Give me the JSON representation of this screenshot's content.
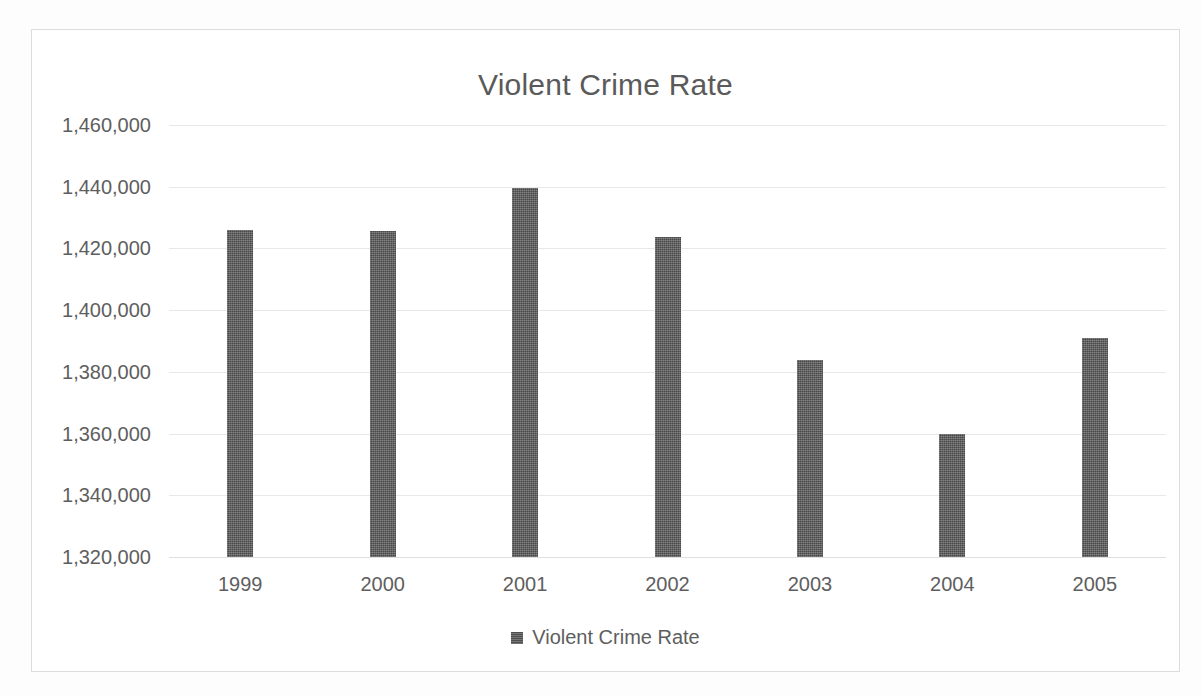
{
  "chart_data": {
    "type": "bar",
    "title": "Violent Crime Rate",
    "xlabel": "",
    "ylabel": "",
    "categories": [
      "1999",
      "2000",
      "2001",
      "2002",
      "2003",
      "2004",
      "2005"
    ],
    "values": [
      1426000,
      1425500,
      1439500,
      1423800,
      1384000,
      1360000,
      1391000
    ],
    "series": [
      {
        "name": "Violent Crime Rate",
        "values": [
          1426000,
          1425500,
          1439500,
          1423800,
          1384000,
          1360000,
          1391000
        ]
      }
    ],
    "ylim": [
      1320000,
      1460000
    ],
    "ytick_values": [
      1460000,
      1440000,
      1420000,
      1400000,
      1380000,
      1360000,
      1340000,
      1320000
    ],
    "ytick_labels": [
      "1,460,000",
      "1,440,000",
      "1,420,000",
      "1,400,000",
      "1,380,000",
      "1,360,000",
      "1,340,000",
      "1,320,000"
    ],
    "grid": true,
    "legend": {
      "position": "bottom",
      "entries": [
        "Violent Crime Rate"
      ]
    },
    "colors": {
      "bar": "#585858",
      "grid": "#e8e8e8",
      "text": "#5e5e5e",
      "title": "#5a5a5a",
      "frame": "#dcdcdc",
      "background": "#ffffff"
    }
  },
  "legend": {
    "label": "Violent Crime Rate",
    "swatch_name": "series-swatch"
  }
}
